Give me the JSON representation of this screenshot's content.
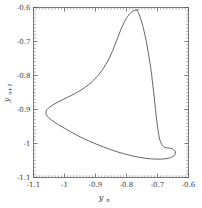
{
  "figure": {
    "background_color": "#ffffff",
    "width": 202,
    "height": 208
  },
  "chart_data": {
    "type": "line",
    "title": "",
    "subtitle": "",
    "xlabel": "y_n",
    "xlabel_base": "y",
    "xlabel_sub": "n",
    "ylabel": "y_{n+1}",
    "ylabel_base": "y",
    "ylabel_sub": "n+1",
    "xlim": [
      -1.1,
      -0.6
    ],
    "ylim": [
      -1.1,
      -0.6
    ],
    "xticks": [
      -1.1,
      -1.0,
      -0.9,
      -0.8,
      -0.7,
      -0.6
    ],
    "xtick_labels": [
      "-1.1",
      "-1",
      "-0.9",
      "-0.8",
      "-0.7",
      "-0.6"
    ],
    "yticks": [
      -1.1,
      -1.0,
      -0.9,
      -0.8,
      -0.7,
      -0.6
    ],
    "ytick_labels": [
      "-1.1",
      "-1",
      "-0.9",
      "-0.8",
      "-0.7",
      "-0.6"
    ],
    "minor_ticks_per_major": 10,
    "grid": false,
    "legend": null,
    "curve_color": "#4a4a4a",
    "curve_width": 0.85,
    "annotations": [],
    "series": [
      {
        "name": "return-map-orbit",
        "closed": true,
        "description": "Closed orbit in the return map with a narrow self-intersecting loop near the lower-right cusp",
        "points": [
          [
            -0.765,
            -0.607
          ],
          [
            -0.772,
            -0.608
          ],
          [
            -0.78,
            -0.611
          ],
          [
            -0.788,
            -0.617
          ],
          [
            -0.796,
            -0.626
          ],
          [
            -0.804,
            -0.638
          ],
          [
            -0.812,
            -0.652
          ],
          [
            -0.82,
            -0.669
          ],
          [
            -0.828,
            -0.688
          ],
          [
            -0.837,
            -0.709
          ],
          [
            -0.846,
            -0.73
          ],
          [
            -0.856,
            -0.75
          ],
          [
            -0.867,
            -0.768
          ],
          [
            -0.879,
            -0.785
          ],
          [
            -0.892,
            -0.8
          ],
          [
            -0.906,
            -0.814
          ],
          [
            -0.921,
            -0.826
          ],
          [
            -0.937,
            -0.837
          ],
          [
            -0.954,
            -0.847
          ],
          [
            -0.972,
            -0.856
          ],
          [
            -0.99,
            -0.864
          ],
          [
            -1.008,
            -0.872
          ],
          [
            -1.025,
            -0.88
          ],
          [
            -1.04,
            -0.888
          ],
          [
            -1.052,
            -0.896
          ],
          [
            -1.059,
            -0.904
          ],
          [
            -1.06,
            -0.912
          ],
          [
            -1.055,
            -0.92
          ],
          [
            -1.046,
            -0.928
          ],
          [
            -1.034,
            -0.936
          ],
          [
            -1.019,
            -0.945
          ],
          [
            -1.002,
            -0.954
          ],
          [
            -0.983,
            -0.964
          ],
          [
            -0.963,
            -0.974
          ],
          [
            -0.942,
            -0.984
          ],
          [
            -0.92,
            -0.993
          ],
          [
            -0.897,
            -1.002
          ],
          [
            -0.874,
            -1.01
          ],
          [
            -0.851,
            -1.018
          ],
          [
            -0.828,
            -1.025
          ],
          [
            -0.805,
            -1.031
          ],
          [
            -0.783,
            -1.036
          ],
          [
            -0.762,
            -1.04
          ],
          [
            -0.742,
            -1.043
          ],
          [
            -0.723,
            -1.045
          ],
          [
            -0.706,
            -1.046
          ],
          [
            -0.69,
            -1.046
          ],
          [
            -0.676,
            -1.045
          ],
          [
            -0.664,
            -1.043
          ],
          [
            -0.654,
            -1.04
          ],
          [
            -0.647,
            -1.036
          ],
          [
            -0.643,
            -1.031
          ],
          [
            -0.642,
            -1.025
          ],
          [
            -0.645,
            -1.02
          ],
          [
            -0.651,
            -1.016
          ],
          [
            -0.659,
            -1.014
          ],
          [
            -0.668,
            -1.013
          ],
          [
            -0.677,
            -1.011
          ],
          [
            -0.684,
            -1.006
          ],
          [
            -0.689,
            -0.998
          ],
          [
            -0.693,
            -0.987
          ],
          [
            -0.696,
            -0.973
          ],
          [
            -0.699,
            -0.956
          ],
          [
            -0.702,
            -0.936
          ],
          [
            -0.705,
            -0.913
          ],
          [
            -0.708,
            -0.887
          ],
          [
            -0.711,
            -0.859
          ],
          [
            -0.715,
            -0.829
          ],
          [
            -0.719,
            -0.797
          ],
          [
            -0.724,
            -0.764
          ],
          [
            -0.73,
            -0.731
          ],
          [
            -0.736,
            -0.7
          ],
          [
            -0.743,
            -0.671
          ],
          [
            -0.75,
            -0.646
          ],
          [
            -0.757,
            -0.626
          ],
          [
            -0.763,
            -0.612
          ],
          [
            -0.765,
            -0.607
          ]
        ]
      }
    ]
  },
  "icons": {
    "x_axis_tick": "tick-mark",
    "y_axis_tick": "tick-mark"
  }
}
